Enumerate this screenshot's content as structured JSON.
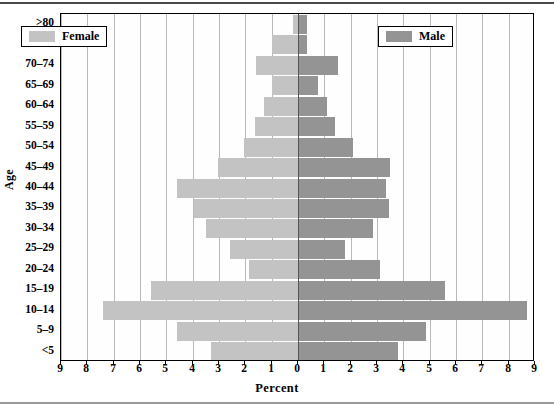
{
  "chart_data": {
    "type": "bar",
    "subtype": "population-pyramid",
    "title": "",
    "xlabel": "Percent",
    "ylabel": "Age",
    "xlim": [
      -9,
      9
    ],
    "xtick_labels": [
      "9",
      "8",
      "7",
      "6",
      "5",
      "4",
      "3",
      "2",
      "1",
      "0",
      "1",
      "2",
      "3",
      "4",
      "5",
      "6",
      "7",
      "8",
      "9"
    ],
    "xtick_values": [
      -9,
      -8,
      -7,
      -6,
      -5,
      -4,
      -3,
      -2,
      -1,
      0,
      1,
      2,
      3,
      4,
      5,
      6,
      7,
      8,
      9
    ],
    "grid": true,
    "legend_position": "inside-top-left and inside-top-right",
    "categories": [
      ">80",
      "75-79",
      "70-74",
      "65-69",
      "60-64",
      "55-59",
      "50-54",
      "45-49",
      "40-44",
      "35-39",
      "30-34",
      "25-29",
      "20-24",
      "15-19",
      "10-14",
      "5-9",
      "<5"
    ],
    "series": [
      {
        "name": "Female",
        "direction": "left",
        "color": "#c3c3c3",
        "values": [
          0.2,
          1.0,
          1.6,
          1.0,
          1.3,
          1.65,
          2.05,
          3.05,
          4.6,
          3.95,
          3.5,
          2.6,
          1.85,
          5.6,
          7.4,
          4.6,
          3.3
        ]
      },
      {
        "name": "Male",
        "direction": "right",
        "color": "#949494",
        "values": [
          0.35,
          0.35,
          1.5,
          0.75,
          1.1,
          1.4,
          2.1,
          3.5,
          3.35,
          3.45,
          2.85,
          1.8,
          3.1,
          5.6,
          8.7,
          4.85,
          3.8
        ]
      }
    ]
  },
  "legends": [
    {
      "id": "female",
      "label": "Female",
      "color": "#c3c3c3"
    },
    {
      "id": "male",
      "label": "Male",
      "color": "#949494"
    }
  ],
  "axes": {
    "y_title": "Age",
    "x_title": "Percent"
  }
}
